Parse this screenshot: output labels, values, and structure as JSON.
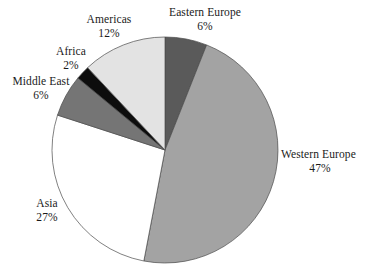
{
  "chart_data": {
    "type": "pie",
    "title": "",
    "subtitle": "",
    "xlabel": "",
    "ylabel": "",
    "legend_position": "none",
    "grid": false,
    "labels_outside": true,
    "start_angle_deg": 0,
    "direction": "clockwise",
    "categories": [
      "Eastern Europe",
      "Western Europe",
      "Asia",
      "Middle East",
      "Africa",
      "Americas"
    ],
    "values": [
      6,
      47,
      27,
      6,
      2,
      12
    ],
    "value_unit": "%",
    "colors": [
      "#5a5a5a",
      "#a3a3a3",
      "#ffffff",
      "#757575",
      "#0d0d0d",
      "#e3e3e3"
    ],
    "outline_color": "#4a4a4a",
    "background": "#ffffff",
    "slices": [
      {
        "name": "Eastern Europe",
        "value": 6,
        "pct_label": "6%",
        "color": "#5a5a5a"
      },
      {
        "name": "Western Europe",
        "value": 47,
        "pct_label": "47%",
        "color": "#a3a3a3"
      },
      {
        "name": "Asia",
        "value": 27,
        "pct_label": "27%",
        "color": "#ffffff"
      },
      {
        "name": "Middle East",
        "value": 6,
        "pct_label": "6%",
        "color": "#757575"
      },
      {
        "name": "Africa",
        "value": 2,
        "pct_label": "2%",
        "color": "#0d0d0d"
      },
      {
        "name": "Americas",
        "value": 12,
        "pct_label": "12%",
        "color": "#e3e3e3"
      }
    ]
  },
  "labels": {
    "eastern_europe": {
      "name": "Eastern Europe",
      "pct": "6%"
    },
    "americas": {
      "name": "Americas",
      "pct": "12%"
    },
    "africa": {
      "name": "Africa",
      "pct": "2%"
    },
    "middle_east": {
      "name": "Middle East",
      "pct": "6%"
    },
    "asia": {
      "name": "Asia",
      "pct": "27%"
    },
    "western_europe": {
      "name": "Western Europe",
      "pct": "47%"
    }
  }
}
